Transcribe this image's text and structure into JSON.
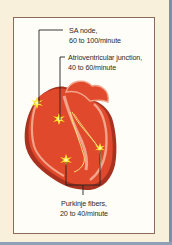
{
  "diagram": {
    "labels": [
      {
        "id": "sa",
        "line1": "SA node,",
        "line2": "60 to 100/minute"
      },
      {
        "id": "av",
        "line1": "Atrioventricular junction,",
        "line2": "40 to 60/minute"
      },
      {
        "id": "purkinje",
        "line1": "Purkinje fibers,",
        "line2": "20 to 40/minute"
      }
    ],
    "colors": {
      "background": "#f9f0dc",
      "panel": "#fffdf7",
      "panel_border": "#8a6a5a",
      "myocardium": "#e0492c",
      "outer_wall": "#a8321f",
      "inner_wall": "#f2a389",
      "conduction": "#f6e07a",
      "spark": "#ffe82a",
      "leader": "#222222"
    }
  }
}
